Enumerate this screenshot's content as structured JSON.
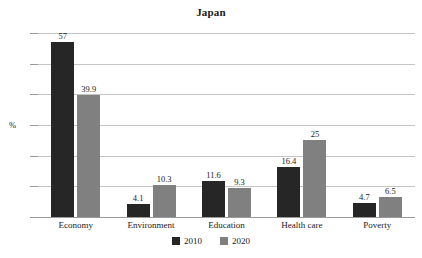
{
  "chart_data": {
    "type": "bar",
    "title": "Japan",
    "xlabel": "",
    "ylabel": "%",
    "ylim": [
      0,
      60
    ],
    "yticks": [
      0,
      10,
      20,
      30,
      40,
      50,
      60
    ],
    "grid": true,
    "legend_position": "bottom",
    "categories": [
      "Economy",
      "Environment",
      "Education",
      "Health care",
      "Poverty"
    ],
    "series": [
      {
        "name": "2010",
        "color": "#262626",
        "values": [
          57,
          4.1,
          11.6,
          16.4,
          4.7
        ],
        "labels": [
          "57",
          "4.1",
          "11.6",
          "16.4",
          "4.7"
        ]
      },
      {
        "name": "2020",
        "color": "#808080",
        "values": [
          39.9,
          10.3,
          9.3,
          25,
          6.5
        ],
        "labels": [
          "39.9",
          "10.3",
          "9.3",
          "25",
          "6.5"
        ]
      }
    ]
  },
  "axis": {
    "tick_labels": [
      "60",
      "50",
      "40",
      "30",
      "20",
      "10",
      "0"
    ],
    "unit_label": "%"
  },
  "legend": {
    "items": [
      {
        "label": "2010"
      },
      {
        "label": "2020"
      }
    ]
  }
}
